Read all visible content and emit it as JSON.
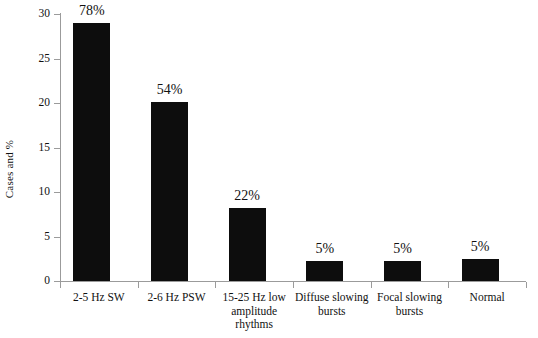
{
  "chart_data": {
    "type": "bar",
    "title": "",
    "xlabel": "",
    "ylabel": "Cases and %",
    "ylim": [
      0,
      30
    ],
    "ytick_values": [
      0,
      5,
      10,
      15,
      20,
      25,
      30
    ],
    "ytick_labels": [
      "0",
      "5",
      "10",
      "15",
      "20",
      "25",
      "30"
    ],
    "grid": false,
    "legend": null,
    "bar_color": "#0d0d0d",
    "axis_color": "#9b9b9b",
    "background_color": "#ffffff",
    "categories": [
      "2-5 Hz SW",
      "2-6 Hz PSW",
      "15-25 Hz low amplitude rhythms",
      "Diffuse slowing bursts",
      "Focal slowing bursts",
      "Normal"
    ],
    "category_label_lines": [
      [
        "2-5 Hz SW"
      ],
      [
        "2-6 Hz PSW"
      ],
      [
        "15-25 Hz low",
        "amplitude",
        "rhythms"
      ],
      [
        "Diffuse slowing",
        "bursts"
      ],
      [
        "Focal slowing",
        "bursts"
      ],
      [
        "Normal"
      ]
    ],
    "values": [
      29,
      20.1,
      8.2,
      2.2,
      2.3,
      2.5
    ],
    "data_labels": [
      "78%",
      "54%",
      "22%",
      "5%",
      "5%",
      "5%"
    ]
  }
}
